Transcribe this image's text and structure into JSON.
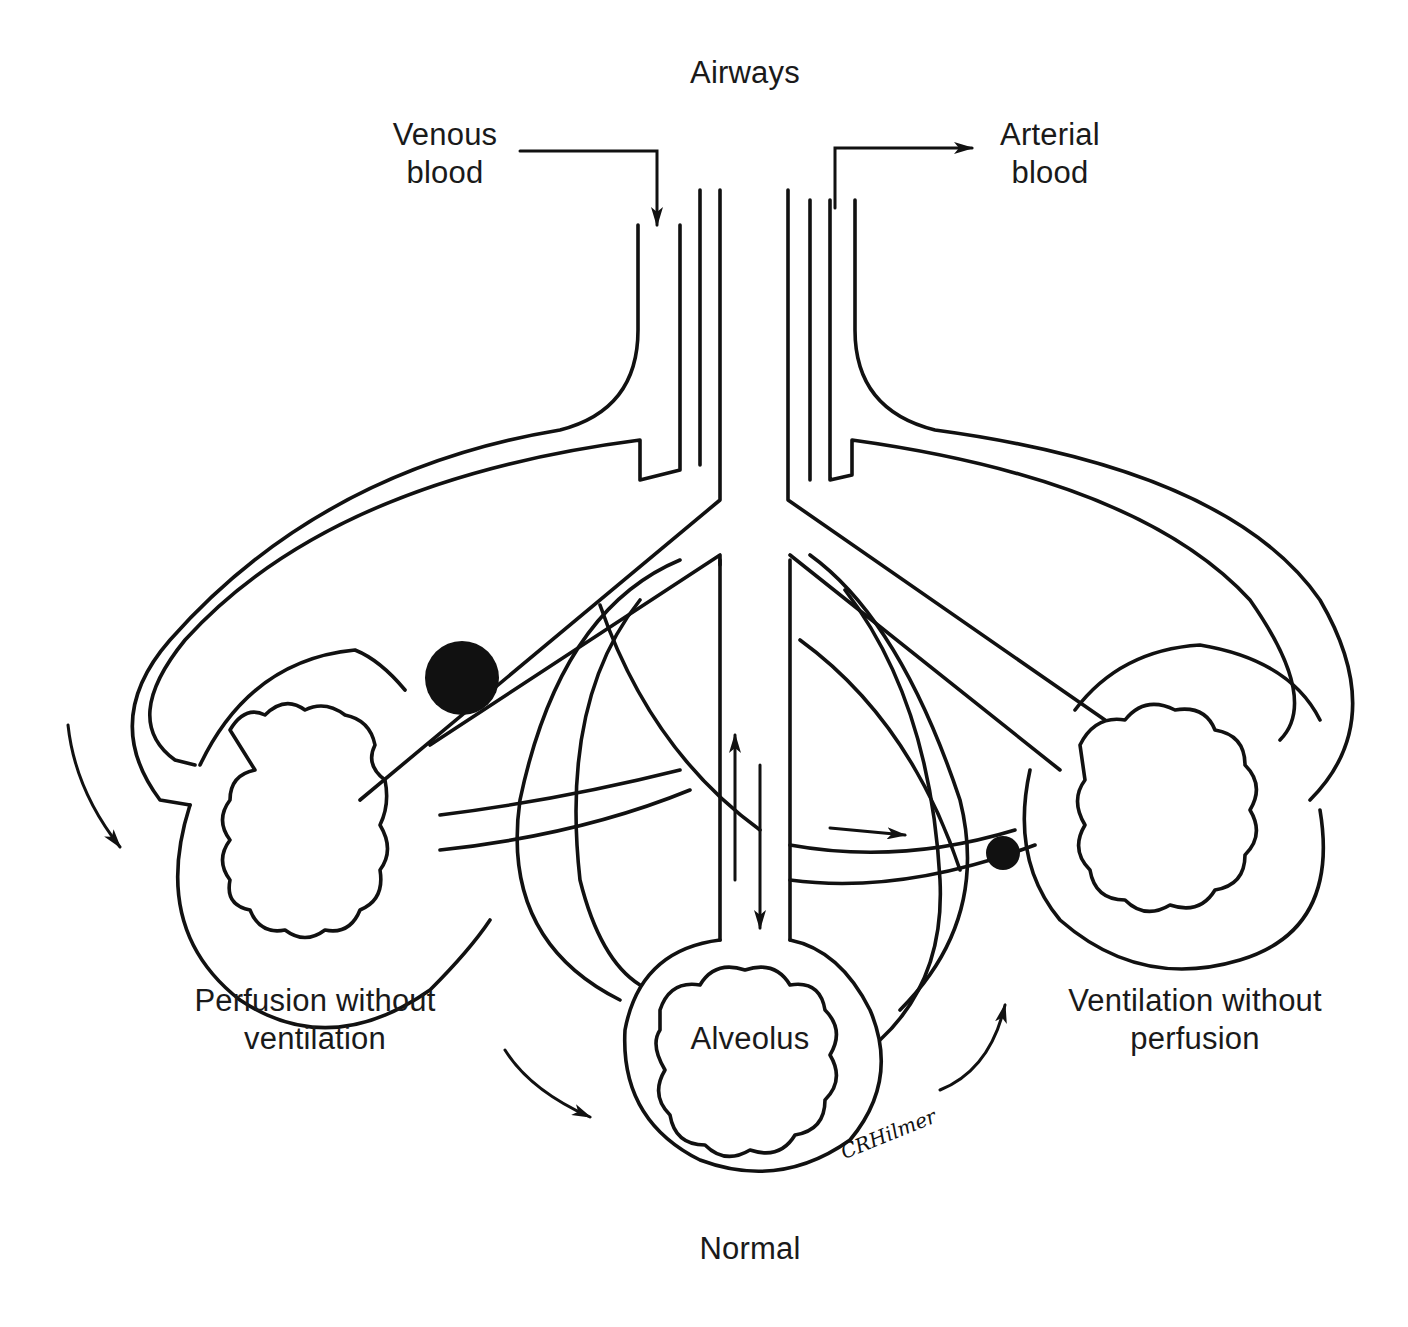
{
  "diagram": {
    "labels": {
      "airways": "Airways",
      "venous_blood_1": "Venous",
      "venous_blood_2": "blood",
      "arterial_blood_1": "Arterial",
      "arterial_blood_2": "blood",
      "alveolus": "Alveolus",
      "left_unit_1": "Perfusion without",
      "left_unit_2": "ventilation",
      "right_unit_1": "Ventilation without",
      "right_unit_2": "perfusion",
      "normal": "Normal",
      "signature": "CRHilmer"
    },
    "units": [
      {
        "name": "left",
        "label": "Perfusion without ventilation",
        "obstruction": "airway"
      },
      {
        "name": "center",
        "label": "Normal",
        "obstruction": "none"
      },
      {
        "name": "right",
        "label": "Ventilation without perfusion",
        "obstruction": "capillary"
      }
    ],
    "colors": {
      "line": "#111111",
      "background": "#ffffff"
    }
  }
}
